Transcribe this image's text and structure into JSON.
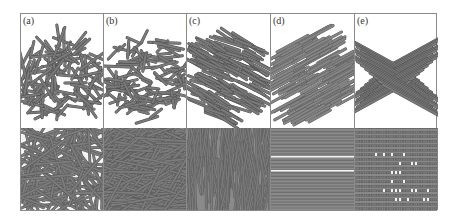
{
  "figure": {
    "panels": [
      {
        "label": "(a)",
        "name": "random-3d",
        "top_style": "random",
        "bottom_style": "random-sparse"
      },
      {
        "label": "(b)",
        "name": "planar-random",
        "top_style": "planar",
        "bottom_style": "random-dense"
      },
      {
        "label": "(c)",
        "name": "aligned-partial",
        "top_style": "aligned-diag",
        "bottom_style": "near-vertical"
      },
      {
        "label": "(d)",
        "name": "unidirectional",
        "top_style": "unidirectional",
        "bottom_style": "horizontal-bands"
      },
      {
        "label": "(e)",
        "name": "orthogonal-grid",
        "top_style": "grid",
        "bottom_style": "grid"
      }
    ],
    "colors": {
      "rod": "#7a7a7a",
      "rod_edge": "#4a4a4a",
      "background_bottom": "#8c8c8c",
      "border": "#8a8a8a"
    }
  }
}
